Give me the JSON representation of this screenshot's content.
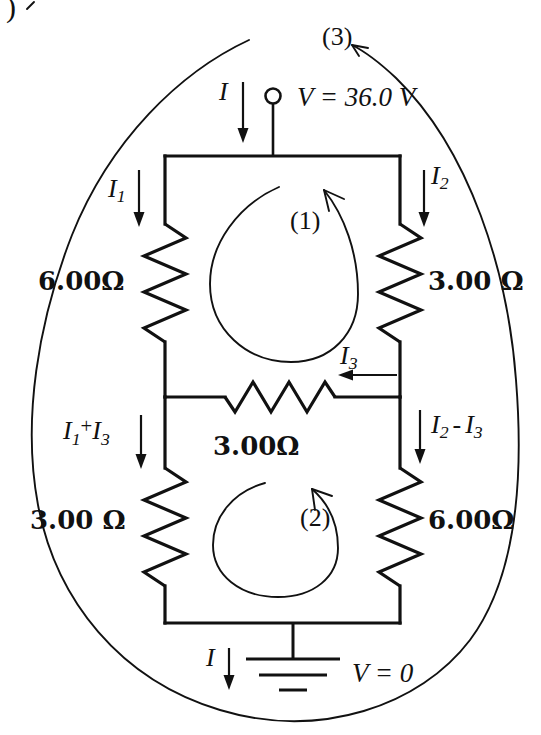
{
  "figure": {
    "kind": "circuit-diagram",
    "title_fragment": ")",
    "background_color": "#ffffff",
    "ink_color": "#111111"
  },
  "source": {
    "label": "V = 36.0 V",
    "current_label_letter": "I",
    "terminal": "open-circle-node"
  },
  "ground": {
    "label": "V = 0",
    "current_label_letter": "I"
  },
  "currents": {
    "top_total": {
      "base": "I",
      "sub": ""
    },
    "left_top": {
      "base": "I",
      "sub": "1"
    },
    "right_top": {
      "base": "I",
      "sub": "2"
    },
    "middle": {
      "base": "I",
      "sub": "3"
    },
    "left_bottom_full": "I1 + I3",
    "left_bottom": {
      "base": "I",
      "sub": "1",
      "op": "+",
      "base2": "I",
      "sub2": "3"
    },
    "right_bottom_full": "I2 - I3",
    "right_bottom": {
      "base": "I",
      "sub": "2",
      "op": "-",
      "base2": "I",
      "sub2": "3"
    },
    "bottom_total": {
      "base": "I",
      "sub": ""
    }
  },
  "resistors": [
    {
      "id": "r-left-top",
      "value": "6.00",
      "unit": "Ω",
      "label": "6.00Ω",
      "position": "left-upper"
    },
    {
      "id": "r-right-top",
      "value": "3.00",
      "unit": "Ω",
      "label": "3.00 Ω",
      "position": "right-upper"
    },
    {
      "id": "r-middle",
      "value": "3.00",
      "unit": "Ω",
      "label": "3.00Ω",
      "position": "middle-horizontal"
    },
    {
      "id": "r-left-bottom",
      "value": "3.00",
      "unit": "Ω",
      "label": "3.00 Ω",
      "position": "left-lower"
    },
    {
      "id": "r-right-bottom",
      "value": "6.00",
      "unit": "Ω",
      "label": "6.00Ω",
      "position": "right-lower"
    }
  ],
  "loops": [
    {
      "id": "loop-1",
      "label": "(1)",
      "direction": "counterclockwise"
    },
    {
      "id": "loop-2",
      "label": "(2)",
      "direction": "counterclockwise"
    },
    {
      "id": "loop-3",
      "label": "(3)",
      "direction": "outer-boundary"
    }
  ]
}
